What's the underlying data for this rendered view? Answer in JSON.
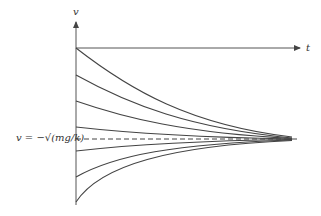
{
  "diagram": {
    "y_axis_label": "v",
    "x_axis_label": "t",
    "asymptote_label": "v = −√(mg/k)",
    "colors": {
      "line": "#444444",
      "background": "#ffffff"
    },
    "axis_origin": {
      "x": 76,
      "y": 48
    },
    "asymptote_y": 139,
    "curve_start_y": [
      48,
      75,
      101,
      127,
      151,
      177,
      202
    ],
    "curve_end_x": 292
  }
}
